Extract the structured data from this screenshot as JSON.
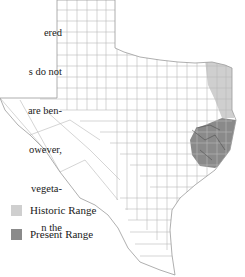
{
  "caption": {
    "lines": [
      "ered",
      "s do not",
      "are ben-",
      "owever,",
      "vegeta-",
      "n the"
    ]
  },
  "map": {
    "region": "Texas counties",
    "colors": {
      "border": "#b8b8b8",
      "historic": "#cfcfcf",
      "present": "#8a8a8a"
    }
  },
  "legend": {
    "items": [
      {
        "label": "Historic Range",
        "color": "#cfcfcf"
      },
      {
        "label": "Present Range",
        "color": "#8a8a8a"
      }
    ]
  }
}
